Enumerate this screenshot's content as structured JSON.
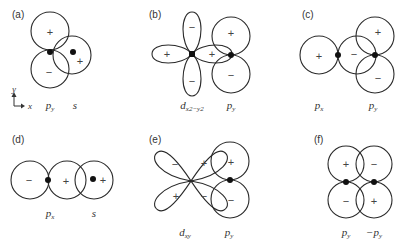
{
  "panels": [
    {
      "id": "a",
      "label": "(a)",
      "orbitals": [
        "p_y",
        "s"
      ],
      "orbital_labels": {
        "first": "p",
        "first_sub": "y",
        "second": "s"
      },
      "signs": {
        "py_top": "+",
        "py_bottom": "−",
        "s": "+"
      }
    },
    {
      "id": "b",
      "label": "(b)",
      "orbitals": [
        "d_x2-y2",
        "p_y"
      ],
      "orbital_labels": {
        "first": "d",
        "first_sub": "x2−y2",
        "second": "p",
        "second_sub": "y"
      },
      "signs": {
        "d_top": "−",
        "d_bottom": "−",
        "d_left": "+",
        "d_right": "+",
        "py_top": "+",
        "py_bottom": "−"
      }
    },
    {
      "id": "c",
      "label": "(c)",
      "orbitals": [
        "p_x",
        "p_y"
      ],
      "orbital_labels": {
        "first": "p",
        "first_sub": "x",
        "second": "p",
        "second_sub": "y"
      },
      "signs": {
        "px_left": "+",
        "px_right": "−",
        "py_top": "+",
        "py_bottom": "−"
      }
    },
    {
      "id": "d",
      "label": "(d)",
      "orbitals": [
        "p_x",
        "s"
      ],
      "orbital_labels": {
        "first": "p",
        "first_sub": "x",
        "second": "s"
      },
      "signs": {
        "px_left": "−",
        "px_right": "+",
        "s": "+"
      }
    },
    {
      "id": "e",
      "label": "(e)",
      "orbitals": [
        "d_xy",
        "p_y"
      ],
      "orbital_labels": {
        "first": "d",
        "first_sub": "xy",
        "second": "p",
        "second_sub": "y"
      },
      "signs": {
        "d_tl": "−",
        "d_tr": "+",
        "d_bl": "+",
        "d_br": "−",
        "py_top": "+",
        "py_bottom": "−"
      }
    },
    {
      "id": "f",
      "label": "(f)",
      "orbitals": [
        "p_y",
        "-p_y"
      ],
      "orbital_labels": {
        "first": "p",
        "first_sub": "y",
        "second": "−p",
        "second_sub": "y"
      },
      "signs": {
        "l_top": "+",
        "l_bottom": "−",
        "r_top": "−",
        "r_bottom": "+"
      }
    }
  ],
  "axes": {
    "x": "x",
    "y": "y"
  }
}
